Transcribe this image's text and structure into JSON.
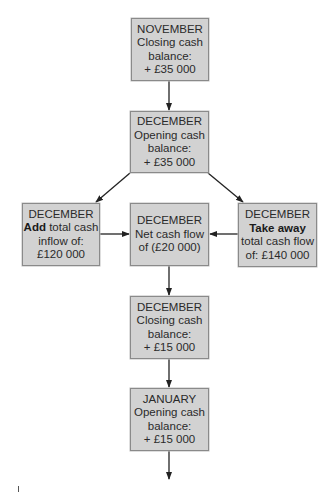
{
  "diagram": {
    "colors": {
      "box_fill": "#d2d2d2",
      "box_border": "#8a8a8a",
      "arrow": "#222222",
      "text": "#2a2a2a"
    },
    "nodes": {
      "nov_closing": {
        "line1": "NOVEMBER",
        "line2": "Closing cash",
        "line3": "balance:",
        "line4": "+ £35 000"
      },
      "dec_opening": {
        "line1": "DECEMBER",
        "line2": "Opening cash",
        "line3": "balance:",
        "line4": "+ £35 000"
      },
      "dec_inflow": {
        "line1": "DECEMBER",
        "line2_bold": "Add",
        "line2_rest": " total cash",
        "line3": "inflow of:",
        "line4": "£120 000"
      },
      "dec_net": {
        "line1": "DECEMBER",
        "line2": "Net cash flow",
        "line3": "of (£20 000)"
      },
      "dec_outflow": {
        "line1": "DECEMBER",
        "line2_bold": "Take away",
        "line3": "total cash flow",
        "line4": "of: £140 000"
      },
      "dec_closing": {
        "line1": "DECEMBER",
        "line2": "Closing cash",
        "line3": "balance:",
        "line4": "+ £15 000"
      },
      "jan_opening": {
        "line1": "JANUARY",
        "line2": "Opening cash",
        "line3": "balance:",
        "line4": "+ £15 000"
      }
    },
    "edges": [
      {
        "from": "nov_closing",
        "to": "dec_opening"
      },
      {
        "from": "dec_opening",
        "to": "dec_inflow"
      },
      {
        "from": "dec_opening",
        "to": "dec_outflow"
      },
      {
        "from": "dec_inflow",
        "to": "dec_net"
      },
      {
        "from": "dec_outflow",
        "to": "dec_net"
      },
      {
        "from": "dec_net",
        "to": "dec_closing"
      },
      {
        "from": "dec_closing",
        "to": "jan_opening"
      },
      {
        "from": "jan_opening",
        "to": "continuation"
      }
    ]
  }
}
